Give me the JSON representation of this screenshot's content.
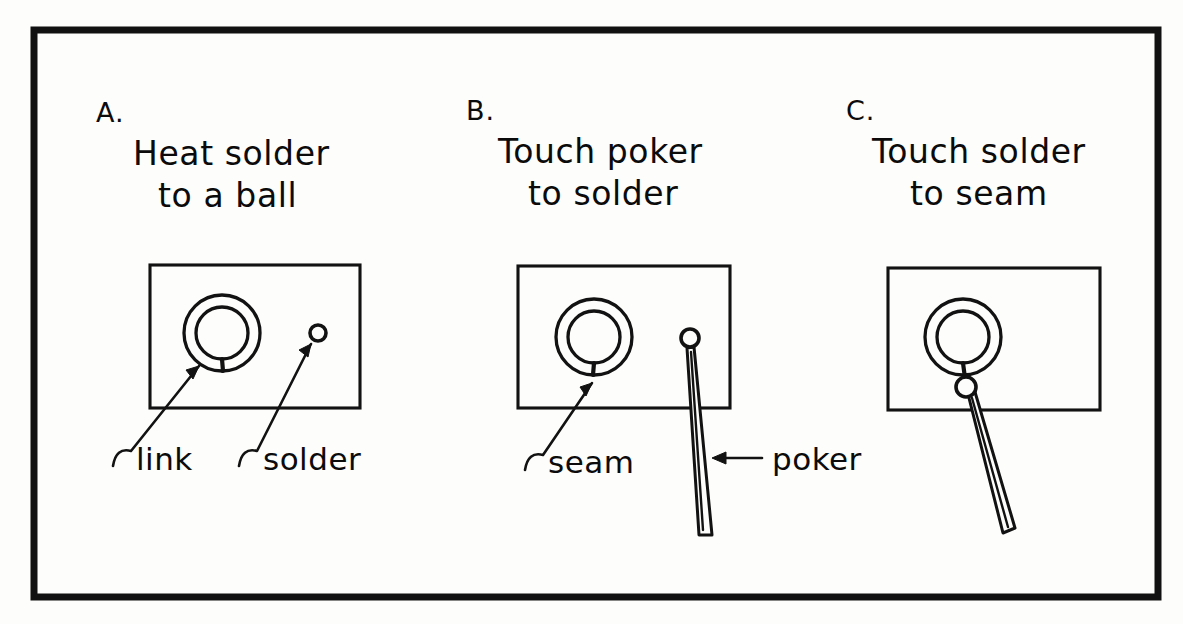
{
  "figure": {
    "background_color": "#fdfdfb",
    "ink_color": "#121212",
    "frame": {
      "x": 34,
      "y": 30,
      "width": 1124,
      "height": 567
    }
  },
  "panels": [
    {
      "letter": "A.",
      "caption_line1": "Heat solder",
      "caption_line2": "to a ball",
      "rect": {
        "x": 150,
        "y": 265,
        "width": 210,
        "height": 143
      },
      "ring": {
        "cx": 222,
        "cy": 333,
        "r_outer": 38,
        "r_inner": 26
      },
      "solder_ball": {
        "cx": 318,
        "cy": 333,
        "r": 8
      },
      "has_poker": false,
      "callouts": [
        {
          "label": "link",
          "text_x": 128,
          "text_y": 470,
          "hook_x": 122,
          "hook_y": 452,
          "tip_x": 199,
          "tip_y": 366
        },
        {
          "label": "solder",
          "text_x": 258,
          "text_y": 470,
          "hook_x": 248,
          "hook_y": 452,
          "tip_x": 311,
          "tip_y": 344
        }
      ]
    },
    {
      "letter": "B.",
      "caption_line1": "Touch poker",
      "caption_line2": "to solder",
      "rect": {
        "x": 518,
        "y": 266,
        "width": 212,
        "height": 142
      },
      "ring": {
        "cx": 594,
        "cy": 337,
        "r_outer": 38,
        "r_inner": 26
      },
      "solder_ball": {
        "cx": 690,
        "cy": 338,
        "r": 9
      },
      "has_poker": true,
      "poker": {
        "tip_x": 690,
        "tip_y": 348,
        "end_x": 706,
        "end_y": 536,
        "width_top": 5,
        "width_bottom": 13
      },
      "callouts": [
        {
          "label": "seam",
          "text_x": 540,
          "text_y": 472,
          "hook_x": 534,
          "hook_y": 456,
          "tip_x": 592,
          "tip_y": 382
        },
        {
          "label": "poker",
          "text_x": 770,
          "text_y": 470,
          "arrow_from_x": 760,
          "arrow_from_y": 458,
          "arrow_to_x": 714,
          "arrow_to_y": 458
        }
      ]
    },
    {
      "letter": "C.",
      "caption_line1": "Touch solder",
      "caption_line2": "to seam",
      "rect": {
        "x": 888,
        "y": 268,
        "width": 212,
        "height": 142
      },
      "ring": {
        "cx": 963,
        "cy": 337,
        "r_outer": 38,
        "r_inner": 26
      },
      "solder_ball": {
        "cx": 966,
        "cy": 387,
        "r": 10
      },
      "has_poker": true,
      "poker": {
        "tip_x": 970,
        "tip_y": 396,
        "end_x": 1012,
        "end_y": 534,
        "width_top": 5,
        "width_bottom": 13
      },
      "callouts": []
    }
  ]
}
